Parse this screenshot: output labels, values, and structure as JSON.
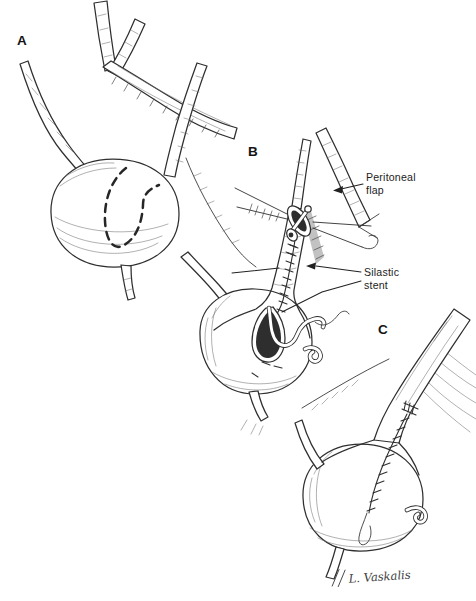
{
  "figure": {
    "background_color": "#ffffff",
    "ink_color": "#2f2f2f",
    "hatch_color": "#6e6e6e",
    "panels": [
      {
        "label": "A"
      },
      {
        "label": "B"
      },
      {
        "label": "C"
      }
    ],
    "annotations": [
      {
        "name": "peritoneal-flap",
        "lines": [
          "Peritoneal",
          "flap"
        ]
      },
      {
        "name": "silastic-stent",
        "lines": [
          "Silastic",
          "stent"
        ]
      }
    ],
    "signature": "L. Vaskalis"
  }
}
